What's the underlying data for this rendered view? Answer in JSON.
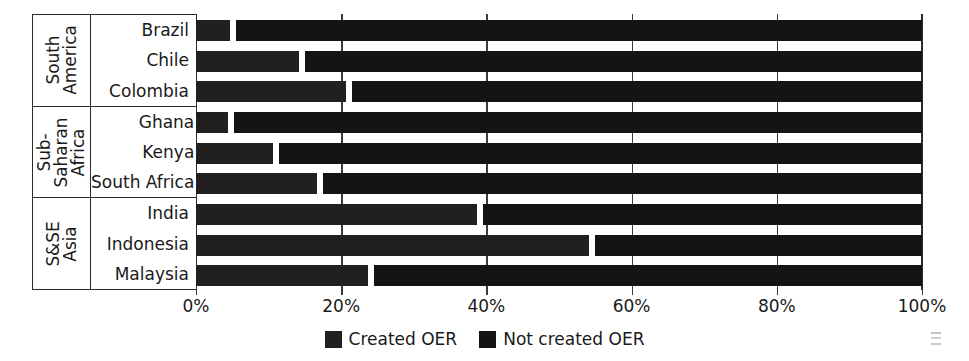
{
  "chart_data": {
    "type": "bar",
    "title": "",
    "xlabel": "",
    "ylabel": "",
    "orientation": "horizontal",
    "stacked": true,
    "stack_mode": "percent",
    "xlim": [
      0,
      100
    ],
    "grid": true,
    "legend_position": "bottom",
    "x_tick_labels": [
      "0%",
      "20%",
      "40%",
      "60%",
      "80%",
      "100%"
    ],
    "x_tick_values": [
      0,
      20,
      40,
      60,
      80,
      100
    ],
    "groups": [
      {
        "name": "South\nAmerica",
        "categories": [
          "Brazil",
          "Chile",
          "Colombia"
        ]
      },
      {
        "name": "Sub-\nSaharan\nAfrica",
        "categories": [
          "Ghana",
          "Kenya",
          "South Africa"
        ]
      },
      {
        "name": "S&SE\nAsia",
        "categories": [
          "India",
          "Indonesia",
          "Malaysia"
        ]
      }
    ],
    "categories": [
      "Brazil",
      "Chile",
      "Colombia",
      "Ghana",
      "Kenya",
      "South Africa",
      "India",
      "Indonesia",
      "Malaysia"
    ],
    "series": [
      {
        "name": "Created OER",
        "color": "#211f1f",
        "values": [
          5.5,
          15.0,
          21.5,
          5.2,
          11.5,
          17.5,
          39.5,
          55.0,
          24.5
        ]
      },
      {
        "name": "Not created OER",
        "color": "#151313",
        "values": [
          94.5,
          85.0,
          78.5,
          94.8,
          88.5,
          82.5,
          60.5,
          45.0,
          75.5
        ]
      }
    ],
    "legend": [
      {
        "label": "Created OER",
        "color": "#211f1f"
      },
      {
        "label": "Not created OER",
        "color": "#151313"
      }
    ]
  },
  "colors": {
    "bar_created": "#211f1f",
    "bar_not_created": "#151313",
    "axis": "#2b2b2b",
    "gridline": "#3b3b3b",
    "background": "#ffffff"
  }
}
